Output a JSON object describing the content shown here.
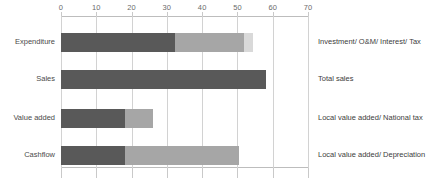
{
  "chart_data": {
    "type": "bar",
    "orientation": "horizontal",
    "stacked": true,
    "title": "",
    "xlabel": "",
    "ylabel": "",
    "xlim": [
      0,
      70
    ],
    "xticks": [
      0,
      10,
      20,
      30,
      40,
      50,
      60,
      70
    ],
    "xtick_labels": [
      "0",
      "10",
      "20",
      "30",
      "40",
      "50",
      "60",
      "70"
    ],
    "grid": true,
    "legend": "none",
    "categories": [
      "Expenditure",
      "Sales",
      "Value added",
      "Cashflow"
    ],
    "series": [
      {
        "name": "segment-1",
        "color": "#595959",
        "values": [
          32.3,
          58.0,
          18.0,
          18.0
        ]
      },
      {
        "name": "segment-2",
        "color": "#a6a6a6",
        "values": [
          19.7,
          0,
          8.0,
          32.5
        ]
      },
      {
        "name": "segment-3",
        "color": "#d9d9d9",
        "values": [
          2.5,
          0,
          0,
          0
        ]
      }
    ],
    "totals": [
      54.5,
      58.0,
      26.0,
      50.5
    ],
    "annotations": [
      "Investment/ O&M/ Interest/ Tax",
      "Total sales",
      "Local value added/ National tax",
      "Local value added/ Depreciation"
    ]
  },
  "colors": {
    "segment_1": "#595959",
    "segment_2": "#a6a6a6",
    "segment_3": "#d9d9d9",
    "gridline": "#d2d2d2",
    "axis": "#bdbdbd",
    "text": "#3f3f3f"
  }
}
